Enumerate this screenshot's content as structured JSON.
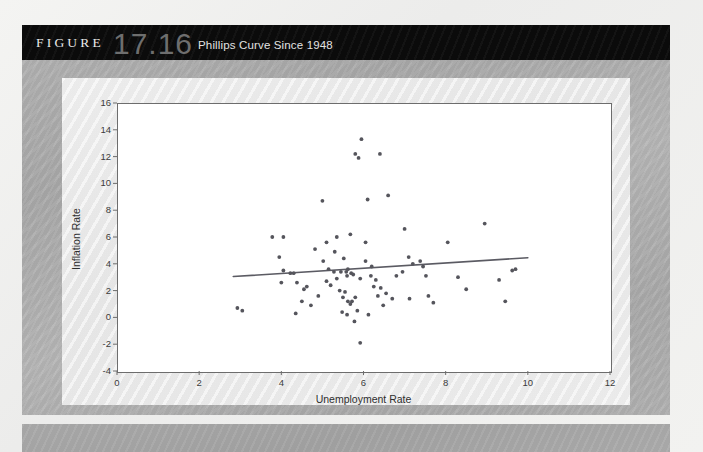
{
  "figure": {
    "label": "FIGURE",
    "number": "17.16",
    "caption": "Phillips Curve Since 1948"
  },
  "colors": {
    "title_bar": "#0b0b0b",
    "mat": "#ababab",
    "panel": "#ececec",
    "canvas": "#ffffff",
    "point": "#55555c",
    "trend_line": "#5b5b63",
    "axis": "#6d6d6d",
    "text": "#2e2e2e"
  },
  "chart_data": {
    "type": "scatter",
    "title": "Phillips Curve Since 1948",
    "xlabel": "Unemployment Rate",
    "ylabel": "Inflation Rate",
    "xlim": [
      0,
      12
    ],
    "ylim": [
      -4,
      16
    ],
    "xticks": [
      0,
      2,
      4,
      6,
      8,
      10,
      12
    ],
    "yticks": [
      -4,
      -2,
      0,
      2,
      4,
      6,
      8,
      10,
      12,
      14,
      16
    ],
    "grid": false,
    "legend": null,
    "points": [
      [
        2.93,
        0.7
      ],
      [
        3.05,
        0.5
      ],
      [
        3.78,
        6.0
      ],
      [
        4.05,
        6.0
      ],
      [
        3.95,
        4.5
      ],
      [
        4.05,
        3.5
      ],
      [
        4.22,
        3.3
      ],
      [
        4.3,
        3.3
      ],
      [
        4.38,
        2.6
      ],
      [
        4.0,
        2.6
      ],
      [
        4.55,
        2.1
      ],
      [
        4.62,
        2.3
      ],
      [
        4.5,
        1.2
      ],
      [
        4.72,
        0.9
      ],
      [
        4.35,
        0.3
      ],
      [
        5.0,
        8.7
      ],
      [
        4.82,
        5.1
      ],
      [
        5.1,
        5.6
      ],
      [
        5.3,
        4.9
      ],
      [
        5.02,
        4.2
      ],
      [
        5.15,
        3.6
      ],
      [
        5.28,
        3.4
      ],
      [
        5.45,
        3.4
      ],
      [
        5.1,
        2.7
      ],
      [
        5.2,
        2.4
      ],
      [
        5.35,
        2.9
      ],
      [
        5.42,
        2.0
      ],
      [
        5.55,
        1.9
      ],
      [
        5.6,
        3.1
      ],
      [
        5.58,
        3.4
      ],
      [
        5.62,
        3.6
      ],
      [
        5.7,
        3.3
      ],
      [
        5.75,
        3.2
      ],
      [
        5.5,
        1.5
      ],
      [
        5.62,
        1.2
      ],
      [
        5.68,
        1.0
      ],
      [
        5.72,
        1.2
      ],
      [
        5.8,
        1.5
      ],
      [
        5.48,
        0.4
      ],
      [
        5.6,
        0.2
      ],
      [
        5.85,
        0.5
      ],
      [
        5.78,
        -0.3
      ],
      [
        5.92,
        -1.9
      ],
      [
        5.52,
        4.4
      ],
      [
        5.68,
        6.2
      ],
      [
        5.35,
        6.0
      ],
      [
        5.8,
        12.2
      ],
      [
        5.88,
        11.9
      ],
      [
        5.95,
        13.3
      ],
      [
        6.1,
        8.8
      ],
      [
        6.05,
        5.6
      ],
      [
        6.2,
        3.8
      ],
      [
        6.18,
        3.1
      ],
      [
        6.3,
        2.8
      ],
      [
        6.25,
        2.3
      ],
      [
        6.42,
        2.2
      ],
      [
        6.35,
        1.6
      ],
      [
        6.55,
        1.8
      ],
      [
        6.48,
        0.9
      ],
      [
        6.7,
        1.4
      ],
      [
        6.8,
        3.1
      ],
      [
        6.95,
        3.4
      ],
      [
        6.4,
        12.2
      ],
      [
        7.0,
        6.6
      ],
      [
        7.1,
        4.5
      ],
      [
        7.2,
        4.0
      ],
      [
        7.38,
        4.2
      ],
      [
        7.45,
        3.8
      ],
      [
        7.52,
        3.1
      ],
      [
        7.12,
        1.4
      ],
      [
        7.58,
        1.6
      ],
      [
        7.7,
        1.1
      ],
      [
        8.05,
        5.6
      ],
      [
        8.3,
        3.0
      ],
      [
        8.5,
        2.1
      ],
      [
        8.95,
        7.0
      ],
      [
        9.3,
        2.8
      ],
      [
        9.45,
        1.2
      ],
      [
        9.62,
        3.5
      ],
      [
        9.7,
        3.6
      ],
      [
        6.6,
        9.1
      ],
      [
        4.9,
        1.6
      ],
      [
        6.05,
        4.2
      ],
      [
        5.92,
        2.9
      ],
      [
        6.12,
        0.2
      ]
    ],
    "trend_line": {
      "x_start": 2.83,
      "y_start": 3.05,
      "x_end": 10.0,
      "y_end": 4.45
    }
  }
}
